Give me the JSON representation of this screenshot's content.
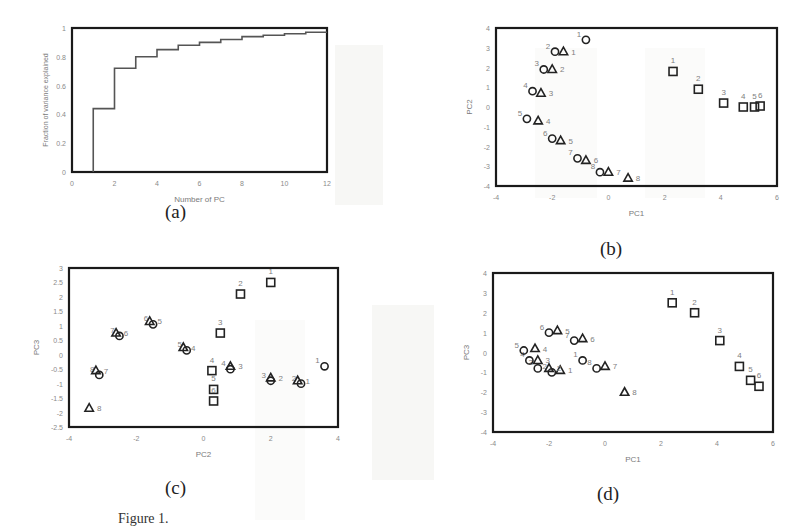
{
  "figure": {
    "caption_visible_fragment": "Figure 1.",
    "panel_labels": [
      "(a)",
      "(b)",
      "(c)",
      "(d)"
    ]
  },
  "chart_data": [
    {
      "id": "a",
      "type": "line",
      "step": true,
      "title": "",
      "xlabel": "Number of PC",
      "ylabel": "Fraction of variance explained",
      "xlim": [
        0,
        12
      ],
      "ylim": [
        0,
        1
      ],
      "xticks": [
        "0",
        "2",
        "4",
        "6",
        "8",
        "10",
        "12"
      ],
      "yticks": [
        "0",
        "0.2",
        "0.4",
        "0.6",
        "0.8",
        "1"
      ],
      "grid": false,
      "x": [
        1,
        2,
        3,
        4,
        5,
        6,
        7,
        8,
        9,
        10,
        11
      ],
      "values": [
        0.44,
        0.72,
        0.8,
        0.85,
        0.88,
        0.9,
        0.92,
        0.94,
        0.95,
        0.96,
        0.97
      ]
    },
    {
      "id": "b",
      "type": "scatter",
      "xlabel": "PC1",
      "ylabel": "PC2",
      "xlim": [
        -4,
        6
      ],
      "ylim": [
        -4,
        4
      ],
      "xticks": [
        "-4",
        "-2",
        "0",
        "2",
        "4",
        "6"
      ],
      "yticks": [
        "-4",
        "-3",
        "-2",
        "-1",
        "0",
        "1",
        "2",
        "3",
        "4"
      ],
      "series": [
        {
          "name": "circle",
          "marker": "o",
          "points": [
            {
              "label": "1",
              "x": -0.8,
              "y": 3.4
            },
            {
              "label": "2",
              "x": -1.9,
              "y": 2.8
            },
            {
              "label": "3",
              "x": -2.3,
              "y": 1.9
            },
            {
              "label": "4",
              "x": -2.7,
              "y": 0.8
            },
            {
              "label": "5",
              "x": -2.9,
              "y": -0.6
            },
            {
              "label": "6",
              "x": -2.0,
              "y": -1.6
            },
            {
              "label": "7",
              "x": -1.1,
              "y": -2.6
            },
            {
              "label": "8",
              "x": -0.3,
              "y": -3.3
            }
          ]
        },
        {
          "name": "triangle",
          "marker": "^",
          "points": [
            {
              "label": "1",
              "x": -1.6,
              "y": 2.8
            },
            {
              "label": "2",
              "x": -2.0,
              "y": 1.9
            },
            {
              "label": "3",
              "x": -2.4,
              "y": 0.7
            },
            {
              "label": "4",
              "x": -2.5,
              "y": -0.7
            },
            {
              "label": "5",
              "x": -1.7,
              "y": -1.7
            },
            {
              "label": "6",
              "x": -0.8,
              "y": -2.7
            },
            {
              "label": "7",
              "x": 0.0,
              "y": -3.3
            },
            {
              "label": "8",
              "x": 0.7,
              "y": -3.6
            }
          ]
        },
        {
          "name": "square",
          "marker": "s",
          "points": [
            {
              "label": "1",
              "x": 2.3,
              "y": 1.8
            },
            {
              "label": "2",
              "x": 3.2,
              "y": 0.9
            },
            {
              "label": "3",
              "x": 4.1,
              "y": 0.2
            },
            {
              "label": "4",
              "x": 4.8,
              "y": 0.0
            },
            {
              "label": "5",
              "x": 5.2,
              "y": 0.0
            },
            {
              "label": "6",
              "x": 5.4,
              "y": 0.05
            }
          ]
        }
      ]
    },
    {
      "id": "c",
      "type": "scatter",
      "xlabel": "PC2",
      "ylabel": "PC3",
      "xlim": [
        -4,
        4
      ],
      "ylim": [
        -2.5,
        3
      ],
      "xticks": [
        "-4",
        "-2",
        "0",
        "2",
        "4"
      ],
      "yticks": [
        "-2.5",
        "-2",
        "-1.5",
        "-1",
        "-0.5",
        "0",
        "0.5",
        "1",
        "1.5",
        "2",
        "2.5",
        "3"
      ],
      "series": [
        {
          "name": "circle",
          "marker": "o",
          "points": [
            {
              "label": "1",
              "x": 3.6,
              "y": -0.4
            },
            {
              "label": "2",
              "x": 2.9,
              "y": -1.0
            },
            {
              "label": "3",
              "x": 2.0,
              "y": -0.9
            },
            {
              "label": "4",
              "x": 0.8,
              "y": -0.5
            },
            {
              "label": "5",
              "x": -0.5,
              "y": 0.15
            },
            {
              "label": "6",
              "x": -1.5,
              "y": 1.05
            },
            {
              "label": "7",
              "x": -2.5,
              "y": 0.65
            },
            {
              "label": "8",
              "x": -3.1,
              "y": -0.7
            }
          ]
        },
        {
          "name": "triangle",
          "marker": "^",
          "points": [
            {
              "label": "1",
              "x": 2.8,
              "y": -0.9
            },
            {
              "label": "2",
              "x": 2.0,
              "y": -0.8
            },
            {
              "label": "3",
              "x": 0.8,
              "y": -0.4
            },
            {
              "label": "4",
              "x": -0.6,
              "y": 0.25
            },
            {
              "label": "5",
              "x": -1.6,
              "y": 1.15
            },
            {
              "label": "6",
              "x": -2.6,
              "y": 0.75
            },
            {
              "label": "7",
              "x": -3.2,
              "y": -0.55
            },
            {
              "label": "8",
              "x": -3.4,
              "y": -1.85
            }
          ]
        },
        {
          "name": "square",
          "marker": "s",
          "points": [
            {
              "label": "1",
              "x": 2.0,
              "y": 2.5
            },
            {
              "label": "2",
              "x": 1.1,
              "y": 2.1
            },
            {
              "label": "3",
              "x": 0.5,
              "y": 0.75
            },
            {
              "label": "4",
              "x": 0.25,
              "y": -0.55
            },
            {
              "label": "5",
              "x": 0.3,
              "y": -1.2
            },
            {
              "label": "6",
              "x": 0.3,
              "y": -1.6
            }
          ]
        }
      ]
    },
    {
      "id": "d",
      "type": "scatter",
      "xlabel": "PC1",
      "ylabel": "PC3",
      "xlim": [
        -4,
        6
      ],
      "ylim": [
        -4,
        4
      ],
      "xticks": [
        "-4",
        "-2",
        "0",
        "2",
        "4",
        "6"
      ],
      "yticks": [
        "-4",
        "-3",
        "-2",
        "-1",
        "0",
        "1",
        "2",
        "3",
        "4"
      ],
      "series": [
        {
          "name": "circle",
          "marker": "o",
          "points": [
            {
              "label": "1",
              "x": -0.8,
              "y": -0.4
            },
            {
              "label": "2",
              "x": -1.9,
              "y": -1.0
            },
            {
              "label": "3",
              "x": -2.4,
              "y": -0.8
            },
            {
              "label": "4",
              "x": -2.7,
              "y": -0.4
            },
            {
              "label": "5",
              "x": -2.9,
              "y": 0.1
            },
            {
              "label": "6",
              "x": -2.0,
              "y": 1.0
            },
            {
              "label": "7",
              "x": -1.1,
              "y": 0.6
            },
            {
              "label": "8",
              "x": -0.3,
              "y": -0.8
            }
          ]
        },
        {
          "name": "triangle",
          "marker": "^",
          "points": [
            {
              "label": "1",
              "x": -1.6,
              "y": -0.9
            },
            {
              "label": "2",
              "x": -2.0,
              "y": -0.8
            },
            {
              "label": "3",
              "x": -2.4,
              "y": -0.4
            },
            {
              "label": "4",
              "x": -2.5,
              "y": 0.2
            },
            {
              "label": "5",
              "x": -1.7,
              "y": 1.1
            },
            {
              "label": "6",
              "x": -0.8,
              "y": 0.7
            },
            {
              "label": "7",
              "x": 0.0,
              "y": -0.7
            },
            {
              "label": "8",
              "x": 0.7,
              "y": -2.0
            }
          ]
        },
        {
          "name": "square",
          "marker": "s",
          "points": [
            {
              "label": "1",
              "x": 2.4,
              "y": 2.5
            },
            {
              "label": "2",
              "x": 3.2,
              "y": 2.0
            },
            {
              "label": "3",
              "x": 4.1,
              "y": 0.6
            },
            {
              "label": "4",
              "x": 4.8,
              "y": -0.7
            },
            {
              "label": "5",
              "x": 5.2,
              "y": -1.4
            },
            {
              "label": "6",
              "x": 5.5,
              "y": -1.7
            }
          ]
        }
      ]
    }
  ]
}
